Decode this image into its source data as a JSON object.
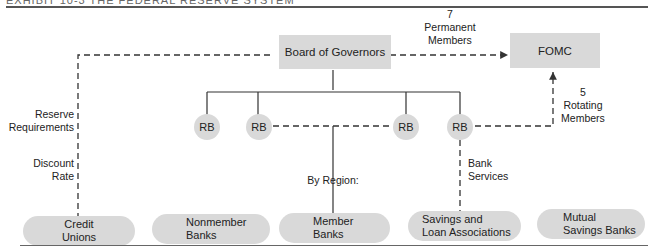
{
  "header": {
    "title": "EXHIBIT 10-3   THE FEDERAL RESERVE SYSTEM"
  },
  "nodes": {
    "board": "Board of  Governors",
    "fomc": "FOMC",
    "rb": [
      "RB",
      "RB",
      "RB",
      "RB"
    ]
  },
  "institutions": [
    {
      "line1": "Credit",
      "line2": "Unions"
    },
    {
      "line1": "Nonmember",
      "line2": "Banks"
    },
    {
      "line1": "Member",
      "line2": "Banks"
    },
    {
      "line1": "Savings and",
      "line2": "Loan Associations"
    },
    {
      "line1": "Mutual",
      "line2": "Savings Banks"
    }
  ],
  "labels": {
    "permanent": {
      "count": "7",
      "line1": "Permanent",
      "line2": "Members"
    },
    "rotating": {
      "count": "5",
      "line1": "Rotating",
      "line2": "Members"
    },
    "reserve": {
      "line1": "Reserve",
      "line2": "Requirements"
    },
    "discount": {
      "line1": "Discount",
      "line2": "Rate"
    },
    "region": "By Region:",
    "bank_services": {
      "line1": "Bank",
      "line2": "Services"
    }
  }
}
